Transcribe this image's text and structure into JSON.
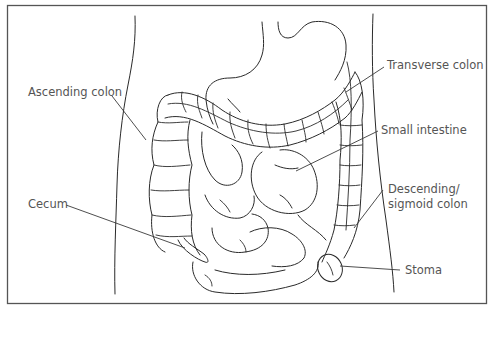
{
  "figure": {
    "caption_fragment": "Figure …",
    "labels": {
      "ascending_colon": "Ascending colon",
      "transverse_colon": "Transverse colon",
      "small_intestine": "Small intestine",
      "descending_sigmoid_colon_line1": "Descending/",
      "descending_sigmoid_colon_line2": "sigmoid colon",
      "cecum": "Cecum",
      "stoma": "Stoma"
    },
    "colors": {
      "line": "#2a2a2a",
      "label_text": "#555555",
      "frame": "#555555",
      "background": "#ffffff"
    }
  }
}
